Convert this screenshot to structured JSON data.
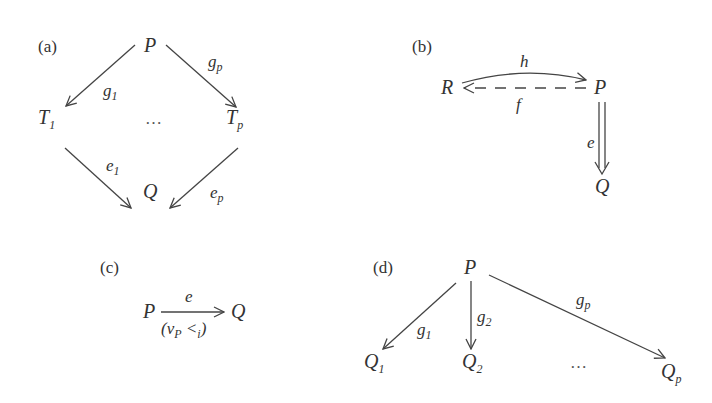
{
  "panels": {
    "a": {
      "label": "(a)",
      "nodes": {
        "P": "P",
        "T1": "T",
        "T1_sub": "1",
        "Tp": "T",
        "Tp_sub": "p",
        "Q": "Q",
        "dots": "…"
      },
      "edges": {
        "g1": {
          "base": "g",
          "sub": "1",
          "from": "P",
          "to": "T1"
        },
        "gp": {
          "base": "g",
          "sub": "p",
          "from": "P",
          "to": "Tp"
        },
        "e1": {
          "base": "e",
          "sub": "1",
          "from": "T1",
          "to": "Q"
        },
        "ep": {
          "base": "e",
          "sub": "p",
          "from": "Tp",
          "to": "Q"
        }
      }
    },
    "b": {
      "label": "(b)",
      "nodes": {
        "R": "R",
        "P": "P",
        "Q": "Q"
      },
      "edges": {
        "h": {
          "base": "h",
          "from": "R",
          "to": "P",
          "style": "curved"
        },
        "f": {
          "base": "f",
          "from": "P",
          "to": "R",
          "style": "dashed"
        },
        "e": {
          "base": "e",
          "from": "P",
          "to": "Q",
          "style": "double"
        }
      }
    },
    "c": {
      "label": "(c)",
      "nodes": {
        "P": "P",
        "Q": "Q"
      },
      "edges": {
        "e": {
          "base": "e",
          "from": "P",
          "to": "Q",
          "annotation_open": "(ν",
          "annotation_sub1": "P",
          "annotation_lt": " <",
          "annotation_sub2": "i",
          "annotation_close": ")"
        }
      }
    },
    "d": {
      "label": "(d)",
      "nodes": {
        "P": "P",
        "Q1": "Q",
        "Q1_sub": "1",
        "Q2": "Q",
        "Q2_sub": "2",
        "Qp": "Q",
        "Qp_sub": "p",
        "dots": "…"
      },
      "edges": {
        "g1": {
          "base": "g",
          "sub": "1",
          "from": "P",
          "to": "Q1"
        },
        "g2": {
          "base": "g",
          "sub": "2",
          "from": "P",
          "to": "Q2"
        },
        "gp": {
          "base": "g",
          "sub": "p",
          "from": "P",
          "to": "Qp"
        }
      }
    }
  }
}
